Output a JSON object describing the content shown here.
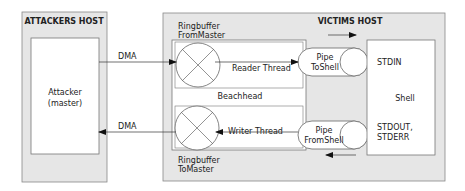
{
  "attackers_host": {
    "title": "ATTACKERS HOST",
    "attacker_line1": "Attacker",
    "attacker_line2": "(master)"
  },
  "victims_host": {
    "title": "VICTIMS HOST",
    "beachhead": "Beachhead",
    "ringbuffer_from_master_line1": "Ringbuffer",
    "ringbuffer_from_master_line2": "FromMaster",
    "ringbuffer_to_master_line1": "Ringbuffer",
    "ringbuffer_to_master_line2": "ToMaster",
    "reader_thread": "Reader Thread",
    "writer_thread": "Writer Thread",
    "pipe_to_shell_line1": "Pipe",
    "pipe_to_shell_line2": "ToShell",
    "pipe_from_shell_line1": "Pipe",
    "pipe_from_shell_line2": "FromShell",
    "shell": "Shell",
    "stdin": "STDIN",
    "stdout": "STDOUT,",
    "stderr": "STDERR"
  },
  "links": {
    "dma_in": "DMA",
    "dma_out": "DMA"
  },
  "colors": {
    "host_fill": "#e6e6e6",
    "stroke": "#555555",
    "box_fill": "#ffffff"
  }
}
